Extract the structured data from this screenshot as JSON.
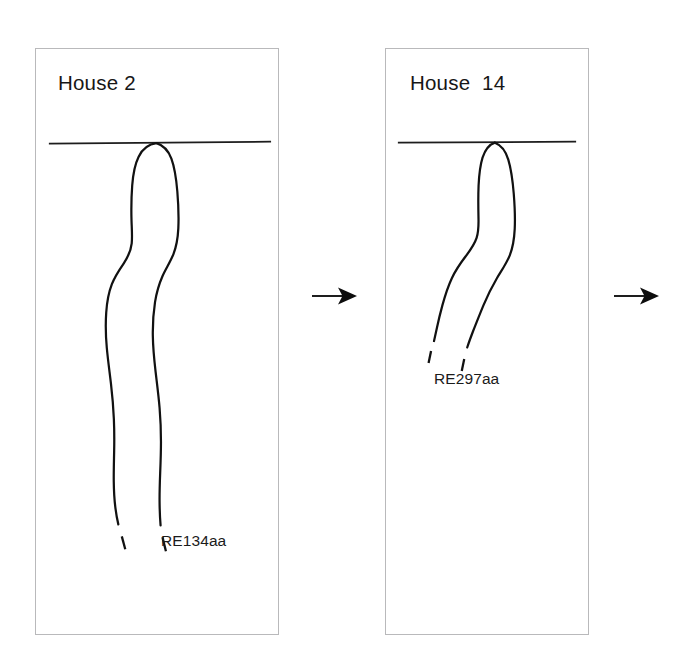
{
  "figure": {
    "background_color": "#ffffff",
    "ink_color": "#111111",
    "frame_color": "#b9b9bb",
    "width": 680,
    "height": 666,
    "kind": "ceramic-vessel-profile-seriation"
  },
  "panels": [
    {
      "id": "house2",
      "title": "House 2",
      "sherd_label": "RE134aa",
      "rim_line": {
        "label": "rim-datum-line"
      },
      "profile": {
        "label": "vessel-profile-drawing",
        "terminates_with": "break-ticks"
      }
    },
    {
      "id": "house14",
      "title": "House  14",
      "sherd_label": "RE297aa",
      "rim_line": {
        "label": "rim-datum-line"
      },
      "profile": {
        "label": "vessel-profile-drawing",
        "terminates_with": "break-ticks"
      }
    }
  ],
  "arrows": [
    {
      "id": "arrow-1",
      "direction": "right",
      "icon": "arrow-right-icon"
    },
    {
      "id": "arrow-2",
      "direction": "right",
      "icon": "arrow-right-icon"
    }
  ]
}
